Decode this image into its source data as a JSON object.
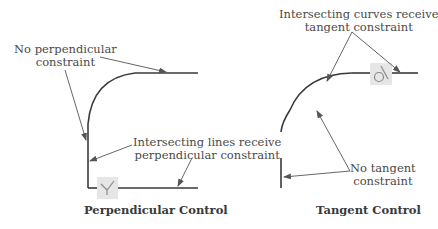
{
  "perpendicular_panel": {
    "caption": "Perpendicular Control",
    "annotations": {
      "no_constraint_line1": "No perpendicular",
      "no_constraint_line2": "constraint",
      "intersect_line1": "Intersecting lines receive",
      "intersect_line2": "perpendicular constraint"
    },
    "icon": "perpendicular-constraint-icon"
  },
  "tangent_panel": {
    "caption": "Tangent Control",
    "annotations": {
      "intersect_line1": "Intersecting curves receive",
      "intersect_line2": "tangent constraint",
      "no_constraint_line1": "No tangent",
      "no_constraint_line2": "constraint"
    },
    "icon": "tangent-constraint-icon"
  },
  "colors": {
    "geometry": "#3a3a3a",
    "leader": "#555555",
    "text": "#4a4a4a",
    "icon_bg": "#e6e6e6",
    "icon_stroke": "#8a8a8a"
  }
}
